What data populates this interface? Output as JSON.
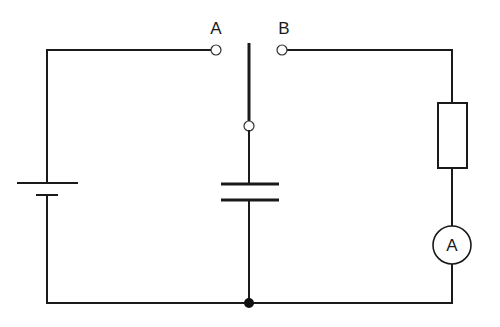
{
  "diagram": {
    "type": "circuit",
    "colors": {
      "line": "#1a1a1a",
      "background": "#ffffff"
    },
    "labels": {
      "terminal_a": "A",
      "terminal_b": "B",
      "ammeter": "A"
    },
    "components": [
      {
        "id": "battery",
        "kind": "cell",
        "position": "left branch"
      },
      {
        "id": "switch",
        "kind": "two-way switch",
        "terminals": [
          "A",
          "B"
        ],
        "pivot": "center"
      },
      {
        "id": "capacitor",
        "kind": "capacitor",
        "position": "center branch"
      },
      {
        "id": "resistor",
        "kind": "resistor",
        "position": "right branch, upper"
      },
      {
        "id": "ammeter",
        "kind": "ammeter",
        "symbol": "A",
        "position": "right branch, lower"
      },
      {
        "id": "junction",
        "kind": "junction node",
        "position": "bottom center"
      }
    ]
  }
}
